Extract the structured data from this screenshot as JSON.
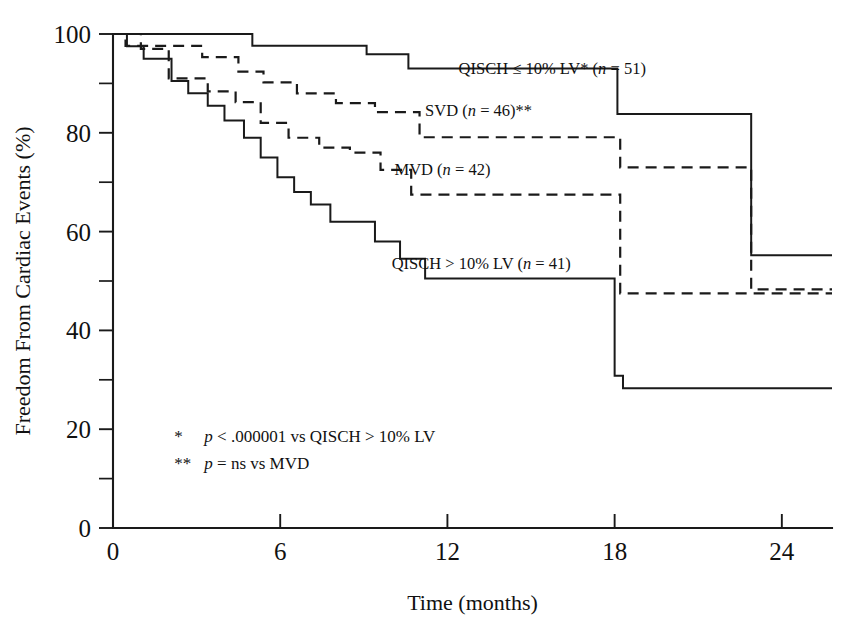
{
  "chart_data": {
    "type": "line",
    "subtype": "kaplan-meier-step",
    "title": "",
    "xlabel": "Time (months)",
    "ylabel": "Freedom From Cardiac Events (%)",
    "xlim": [
      0,
      25.8
    ],
    "ylim": [
      0,
      100
    ],
    "xticks": [
      0,
      6,
      12,
      18,
      24
    ],
    "xtick_labels": [
      "0",
      "6",
      "12",
      "18",
      "24"
    ],
    "yticks": [
      0,
      20,
      40,
      60,
      80,
      100
    ],
    "ytick_labels": [
      "0",
      "20",
      "40",
      "60",
      "80",
      "100"
    ],
    "yticks_minor": [
      10,
      30,
      50,
      70,
      90
    ],
    "grid": false,
    "legend_position": "inline-annotations",
    "series": [
      {
        "name": "QISCH ≤ 10% LV* (n = 51)",
        "label_plain": "QISCH ≤ 10% LV* (n = 51)",
        "label_prefix": "QISCH ≤ 10% LV* (",
        "label_italic": "n",
        "label_suffix": " = 51)",
        "style": "solid",
        "n": 51,
        "label_x": 12.4,
        "label_y": 92.0,
        "x": [
          0,
          5.0,
          9.1,
          10.6,
          11.1,
          18.1,
          22.9,
          25.8
        ],
        "y": [
          100,
          100,
          97.6,
          95.9,
          93.0,
          93.0,
          83.8,
          55.2
        ],
        "points": [
          {
            "t": 0.0,
            "v": 100.0
          },
          {
            "t": 5.0,
            "v": 100.0
          },
          {
            "t": 5.0,
            "v": 97.6
          },
          {
            "t": 9.1,
            "v": 97.6
          },
          {
            "t": 9.1,
            "v": 95.9
          },
          {
            "t": 10.6,
            "v": 95.9
          },
          {
            "t": 10.6,
            "v": 93.0
          },
          {
            "t": 18.1,
            "v": 93.0
          },
          {
            "t": 18.1,
            "v": 83.8
          },
          {
            "t": 22.9,
            "v": 83.8
          },
          {
            "t": 22.9,
            "v": 55.2
          },
          {
            "t": 25.8,
            "v": 55.2
          }
        ]
      },
      {
        "name": "SVD (n = 46)**",
        "label_plain": "SVD (n = 46)**",
        "label_prefix": "SVD (",
        "label_italic": "n",
        "label_suffix": " = 46)**",
        "style": "dashed",
        "n": 46,
        "label_x": 11.2,
        "label_y": 83.5,
        "x": [
          0,
          0.45,
          3.2,
          4.5,
          5.4,
          6.6,
          8.0,
          9.4,
          11.0,
          18.2,
          22.9,
          25.8
        ],
        "y": [
          100,
          97.6,
          95.3,
          92.4,
          90.2,
          88.0,
          86.0,
          84.2,
          79.1,
          79.1,
          73.0,
          48.3
        ],
        "points": [
          {
            "t": 0.0,
            "v": 100.0
          },
          {
            "t": 0.45,
            "v": 100.0
          },
          {
            "t": 0.45,
            "v": 97.6
          },
          {
            "t": 3.2,
            "v": 97.6
          },
          {
            "t": 3.2,
            "v": 95.3
          },
          {
            "t": 4.5,
            "v": 95.3
          },
          {
            "t": 4.5,
            "v": 92.4
          },
          {
            "t": 5.4,
            "v": 92.4
          },
          {
            "t": 5.4,
            "v": 90.2
          },
          {
            "t": 6.6,
            "v": 90.2
          },
          {
            "t": 6.6,
            "v": 88.0
          },
          {
            "t": 8.0,
            "v": 88.0
          },
          {
            "t": 8.0,
            "v": 86.0
          },
          {
            "t": 9.4,
            "v": 86.0
          },
          {
            "t": 9.4,
            "v": 84.2
          },
          {
            "t": 11.0,
            "v": 84.2
          },
          {
            "t": 11.0,
            "v": 79.1
          },
          {
            "t": 18.2,
            "v": 79.1
          },
          {
            "t": 18.2,
            "v": 73.0
          },
          {
            "t": 22.9,
            "v": 73.0
          },
          {
            "t": 22.9,
            "v": 48.3
          },
          {
            "t": 25.8,
            "v": 48.3
          }
        ]
      },
      {
        "name": "MVD (n = 42)",
        "label_plain": "MVD (n = 42)",
        "label_prefix": "MVD (",
        "label_italic": "n",
        "label_suffix": " = 42)",
        "style": "dashed",
        "n": 42,
        "label_x": 10.1,
        "label_y": 71.5,
        "x": [
          0,
          1.0,
          2.0,
          3.4,
          4.4,
          5.3,
          6.3,
          7.4,
          8.5,
          9.6,
          10.7,
          18.2,
          22.6,
          25.8
        ],
        "y": [
          100,
          97.0,
          91.0,
          88.4,
          86.2,
          82.0,
          79.0,
          77.0,
          76.0,
          72.5,
          67.5,
          67.5,
          47.5,
          47.5
        ],
        "points": [
          {
            "t": 0.0,
            "v": 100.0
          },
          {
            "t": 1.0,
            "v": 100.0
          },
          {
            "t": 1.0,
            "v": 97.0
          },
          {
            "t": 2.0,
            "v": 97.0
          },
          {
            "t": 2.0,
            "v": 91.0
          },
          {
            "t": 3.4,
            "v": 91.0
          },
          {
            "t": 3.4,
            "v": 88.4
          },
          {
            "t": 4.4,
            "v": 88.4
          },
          {
            "t": 4.4,
            "v": 86.2
          },
          {
            "t": 5.3,
            "v": 86.2
          },
          {
            "t": 5.3,
            "v": 82.0
          },
          {
            "t": 6.3,
            "v": 82.0
          },
          {
            "t": 6.3,
            "v": 79.0
          },
          {
            "t": 7.4,
            "v": 79.0
          },
          {
            "t": 7.4,
            "v": 77.0
          },
          {
            "t": 8.5,
            "v": 77.0
          },
          {
            "t": 8.5,
            "v": 76.0
          },
          {
            "t": 9.6,
            "v": 76.0
          },
          {
            "t": 9.6,
            "v": 72.5
          },
          {
            "t": 10.7,
            "v": 72.5
          },
          {
            "t": 10.7,
            "v": 67.5
          },
          {
            "t": 18.2,
            "v": 67.5
          },
          {
            "t": 18.2,
            "v": 47.5
          },
          {
            "t": 25.8,
            "v": 47.5
          }
        ]
      },
      {
        "name": "QISCH > 10% LV (n = 41)",
        "label_plain": "QISCH > 10% LV (n = 41)",
        "label_prefix": "QISCH > 10% LV (",
        "label_italic": "n",
        "label_suffix": " = 41)",
        "style": "solid",
        "n": 41,
        "label_x": 10.0,
        "label_y": 52.5,
        "x": [
          0,
          0.5,
          1.1,
          2.1,
          2.7,
          3.4,
          4.0,
          4.7,
          5.3,
          5.9,
          6.5,
          7.1,
          7.8,
          8.5,
          9.4,
          10.3,
          11.2,
          12.3,
          18.0,
          18.3,
          25.8
        ],
        "y": [
          100,
          97.5,
          95.0,
          90.5,
          88.0,
          85.5,
          82.5,
          79.0,
          75.0,
          71.0,
          68.0,
          65.5,
          62.0,
          62.0,
          58.0,
          54.5,
          50.5,
          50.5,
          50.5,
          28.3,
          28.3
        ],
        "points": [
          {
            "t": 0.0,
            "v": 100.0
          },
          {
            "t": 0.5,
            "v": 100.0
          },
          {
            "t": 0.5,
            "v": 97.5
          },
          {
            "t": 1.1,
            "v": 97.5
          },
          {
            "t": 1.1,
            "v": 95.0
          },
          {
            "t": 2.1,
            "v": 95.0
          },
          {
            "t": 2.1,
            "v": 90.5
          },
          {
            "t": 2.7,
            "v": 90.5
          },
          {
            "t": 2.7,
            "v": 88.0
          },
          {
            "t": 3.4,
            "v": 88.0
          },
          {
            "t": 3.4,
            "v": 85.5
          },
          {
            "t": 4.0,
            "v": 85.5
          },
          {
            "t": 4.0,
            "v": 82.5
          },
          {
            "t": 4.7,
            "v": 82.5
          },
          {
            "t": 4.7,
            "v": 79.0
          },
          {
            "t": 5.3,
            "v": 79.0
          },
          {
            "t": 5.3,
            "v": 75.0
          },
          {
            "t": 5.9,
            "v": 75.0
          },
          {
            "t": 5.9,
            "v": 71.0
          },
          {
            "t": 6.5,
            "v": 71.0
          },
          {
            "t": 6.5,
            "v": 68.0
          },
          {
            "t": 7.1,
            "v": 68.0
          },
          {
            "t": 7.1,
            "v": 65.5
          },
          {
            "t": 7.8,
            "v": 65.5
          },
          {
            "t": 7.8,
            "v": 62.0
          },
          {
            "t": 9.4,
            "v": 62.0
          },
          {
            "t": 9.4,
            "v": 58.0
          },
          {
            "t": 10.3,
            "v": 58.0
          },
          {
            "t": 10.3,
            "v": 54.5
          },
          {
            "t": 11.2,
            "v": 54.5
          },
          {
            "t": 11.2,
            "v": 50.5
          },
          {
            "t": 18.0,
            "v": 50.5
          },
          {
            "t": 18.0,
            "v": 30.8
          },
          {
            "t": 18.3,
            "v": 30.8
          },
          {
            "t": 18.3,
            "v": 28.3
          },
          {
            "t": 25.8,
            "v": 28.3
          }
        ]
      }
    ],
    "annotations": [
      {
        "marker": "*",
        "prefix": "",
        "italic": "p",
        "suffix": " < .000001 vs QISCH > 10% LV",
        "text": "*   p < .000001 vs QISCH > 10% LV",
        "x": 2.2,
        "y": 17.5
      },
      {
        "marker": "**",
        "prefix": "",
        "italic": "p",
        "suffix": " = ns vs MVD",
        "text": "**  p = ns vs MVD",
        "x": 2.2,
        "y": 12.0
      }
    ]
  },
  "colors": {
    "ink": "#1a1a1a",
    "background": "#ffffff"
  }
}
